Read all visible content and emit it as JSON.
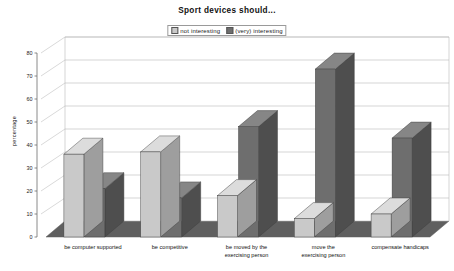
{
  "chart_data": {
    "type": "bar",
    "title": "Sport devices should...",
    "xlabel": "",
    "ylabel": "percentage",
    "ylim": [
      0,
      80
    ],
    "yticks": [
      0,
      10,
      20,
      30,
      40,
      50,
      60,
      70,
      80
    ],
    "grid": true,
    "legend_position": "top-center",
    "style": "3d-grouped-bars",
    "categories": [
      "be computer supported",
      "be competitive",
      "be moved by the exercising person",
      "move the exercising person",
      "compensate handicaps"
    ],
    "series": [
      {
        "name": "not interesting",
        "color": "#c9c9c9",
        "values": [
          36,
          37,
          18,
          8,
          10
        ]
      },
      {
        "name": "(very) interesting",
        "color": "#6e6e6e",
        "values": [
          21,
          17,
          48,
          73,
          43
        ]
      }
    ]
  },
  "legend": {
    "entries": [
      {
        "label": "not interesting"
      },
      {
        "label": "(very) interesting"
      }
    ]
  },
  "colors": {
    "series_light_front": "#c9c9c9",
    "series_light_side": "#9e9e9e",
    "series_light_top": "#dcdcdc",
    "series_dark_front": "#6e6e6e",
    "series_dark_side": "#4e4e4e",
    "series_dark_top": "#868686",
    "floor": "#5f5f5f",
    "gridline": "#b9b9b9",
    "axis": "#6d6d6d"
  }
}
